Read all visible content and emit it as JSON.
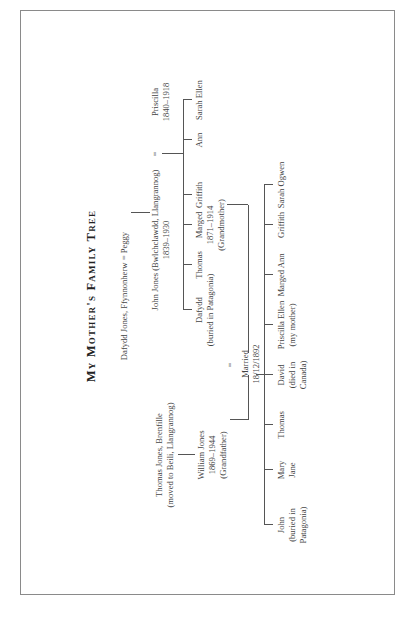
{
  "title": "My Mother's Family Tree",
  "generation1": {
    "left": "Dafydd Jones, Ffynnonherw",
    "eq": "=",
    "right": "Peggy"
  },
  "generation2": {
    "john": [
      "John Jones (Bwlchclawdd, Llangrannog)",
      "1839–1930"
    ],
    "eq": "=",
    "priscilla": [
      "Priscilla",
      "1840–1918"
    ]
  },
  "siblings": [
    {
      "lines": [
        "Dafydd",
        "(buried in Patagonia)"
      ]
    },
    {
      "lines": [
        "Thomas"
      ]
    },
    {
      "lines": [
        "Marged",
        "1871–1914",
        "(Grandmother)"
      ]
    },
    {
      "lines": [
        "Griffith"
      ]
    },
    {
      "lines": [
        "Ann"
      ]
    },
    {
      "lines": [
        "Sarah Ellen"
      ]
    }
  ],
  "paternal": {
    "thomas": [
      "Thomas Jones, Brenfille",
      "(moved to Beili, Llangrannog)"
    ],
    "william": [
      "William Jones",
      "1869–1944",
      "(Grandfather)"
    ]
  },
  "marriage": {
    "eq": "=",
    "lines": [
      "Married",
      "18/12/1892"
    ]
  },
  "children": [
    {
      "lines": [
        "John",
        "(buried in",
        "Patagonia)"
      ]
    },
    {
      "lines": [
        "Mary",
        "Jane"
      ]
    },
    {
      "lines": [
        "Thomas"
      ]
    },
    {
      "lines": [
        "David",
        "(died in",
        "Canada)"
      ]
    },
    {
      "lines": [
        "Priscilla Ellen",
        "(my mother)"
      ]
    },
    {
      "lines": [
        "Marged Ann"
      ]
    },
    {
      "lines": [
        "Griffith"
      ]
    },
    {
      "lines": [
        "Sarah Ogwen"
      ]
    }
  ]
}
